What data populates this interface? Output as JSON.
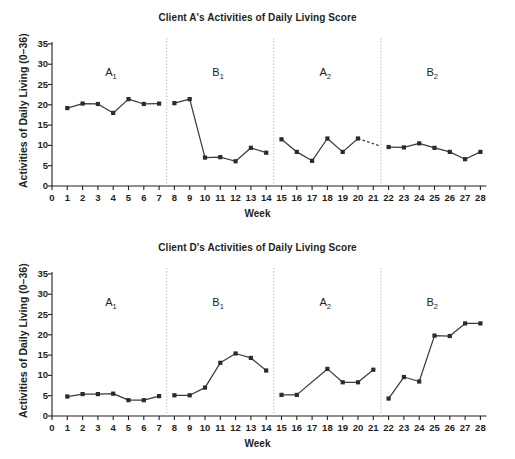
{
  "figure": {
    "xlabel": "Week",
    "ylabel": "Activities of Daily Living (0–36)",
    "yticks": [
      "0",
      "5",
      "10",
      "15",
      "20",
      "25",
      "30",
      "35"
    ],
    "xticks": [
      "0",
      "1",
      "2",
      "3",
      "4",
      "5",
      "6",
      "7",
      "8",
      "9",
      "10",
      "11",
      "12",
      "13",
      "14",
      "15",
      "16",
      "17",
      "18",
      "19",
      "20",
      "21",
      "22",
      "23",
      "24",
      "25",
      "26",
      "27",
      "28"
    ],
    "phase_labels": [
      "A",
      "B",
      "A",
      "B"
    ],
    "phase_subs": [
      "1",
      "1",
      "2",
      "2"
    ],
    "line_color": "#3c3c3c",
    "marker_color": "#2b2b2b",
    "divider_color": "#b9b9b9"
  },
  "chart_data": [
    {
      "type": "line",
      "title": "Client A's Activities of Daily Living Score",
      "xlabel": "Week",
      "ylabel": "Activities of Daily Living (0–36)",
      "xlim": [
        0,
        28
      ],
      "ylim": [
        0,
        36
      ],
      "yticks": [
        0,
        5,
        10,
        15,
        20,
        25,
        30,
        35
      ],
      "grid": false,
      "legend": false,
      "phase_dividers": [
        7.5,
        14.5,
        21.5
      ],
      "phases": [
        {
          "name": "A1",
          "label": "A",
          "sub": "1",
          "weeks": [
            1,
            2,
            3,
            4,
            5,
            6,
            7
          ],
          "values": [
            19.2,
            20.3,
            20.2,
            18.0,
            21.4,
            20.2,
            20.3
          ]
        },
        {
          "name": "B1",
          "label": "B",
          "sub": "1",
          "weeks": [
            8,
            9,
            10,
            11,
            12,
            13,
            14
          ],
          "values": [
            20.4,
            21.4,
            7.0,
            7.1,
            6.1,
            9.4,
            8.2
          ]
        },
        {
          "name": "A2",
          "label": "A",
          "sub": "2",
          "weeks": [
            15,
            16,
            17,
            18,
            19,
            20
          ],
          "values": [
            11.5,
            8.4,
            6.2,
            11.7,
            8.4,
            11.7
          ],
          "trailing_dashed_to_week": 21.4,
          "trailing_dashed_to_value": 9.9
        },
        {
          "name": "B2",
          "label": "B",
          "sub": "2",
          "weeks": [
            22,
            23,
            24,
            25,
            26,
            27,
            28
          ],
          "values": [
            9.6,
            9.5,
            10.5,
            9.4,
            8.4,
            6.6,
            8.4
          ]
        }
      ]
    },
    {
      "type": "line",
      "title": "Client D's Activities of Daily Living Score",
      "xlabel": "Week",
      "ylabel": "Activities of Daily Living (0–36)",
      "xlim": [
        0,
        28
      ],
      "ylim": [
        0,
        36
      ],
      "yticks": [
        0,
        5,
        10,
        15,
        20,
        25,
        30,
        35
      ],
      "grid": false,
      "legend": false,
      "phase_dividers": [
        7.5,
        14.5,
        21.5
      ],
      "phases": [
        {
          "name": "A1",
          "label": "A",
          "sub": "1",
          "weeks": [
            1,
            2,
            3,
            4,
            5,
            6,
            7
          ],
          "values": [
            4.8,
            5.4,
            5.4,
            5.5,
            3.9,
            3.9,
            4.9
          ]
        },
        {
          "name": "B1",
          "label": "B",
          "sub": "1",
          "weeks": [
            8,
            9,
            10,
            11,
            12,
            13,
            14
          ],
          "values": [
            5.1,
            5.1,
            7.0,
            13.1,
            15.4,
            14.3,
            11.2
          ]
        },
        {
          "name": "A2",
          "label": "A",
          "sub": "2",
          "weeks": [
            15,
            16,
            18,
            19,
            20,
            21
          ],
          "values": [
            5.2,
            5.2,
            11.6,
            8.3,
            8.3,
            11.4
          ]
        },
        {
          "name": "B2",
          "label": "B",
          "sub": "2",
          "weeks": [
            22,
            23,
            24,
            25,
            26,
            27,
            28
          ],
          "values": [
            4.3,
            9.6,
            8.5,
            19.8,
            19.7,
            22.8,
            22.8
          ]
        }
      ]
    }
  ]
}
